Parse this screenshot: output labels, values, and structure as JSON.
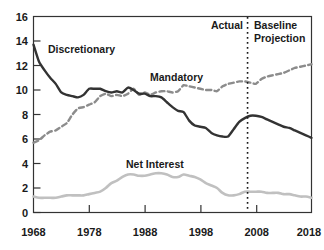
{
  "chart_data": {
    "type": "line",
    "title": "",
    "xlabel": "",
    "ylabel": "",
    "xlim": [
      1968,
      2018
    ],
    "ylim": [
      0,
      16
    ],
    "grid": false,
    "legend_position": "inline-labels",
    "xticks": [
      "1968",
      "1978",
      "1988",
      "1998",
      "2008",
      "2018"
    ],
    "xtick_values": [
      1968,
      1978,
      1988,
      1998,
      2008,
      2018
    ],
    "yticks": [
      "0",
      "2",
      "4",
      "6",
      "8",
      "10",
      "12",
      "14",
      "16"
    ],
    "ytick_values": [
      0,
      2,
      4,
      6,
      8,
      10,
      12,
      14,
      16
    ],
    "x": [
      1968,
      1969,
      1970,
      1971,
      1972,
      1973,
      1974,
      1975,
      1976,
      1977,
      1978,
      1979,
      1980,
      1981,
      1982,
      1983,
      1984,
      1985,
      1986,
      1987,
      1988,
      1989,
      1990,
      1991,
      1992,
      1993,
      1994,
      1995,
      1996,
      1997,
      1998,
      1999,
      2000,
      2001,
      2002,
      2003,
      2004,
      2005,
      2006,
      2007,
      2008,
      2009,
      2010,
      2011,
      2012,
      2013,
      2014,
      2015,
      2016,
      2017,
      2018
    ],
    "series": [
      {
        "name": "Discretionary",
        "style": "solid",
        "color": "#333333",
        "values": [
          13.7,
          12.3,
          11.6,
          11.0,
          10.5,
          9.8,
          9.6,
          9.5,
          9.4,
          9.6,
          10.1,
          10.1,
          10.1,
          9.9,
          9.8,
          9.9,
          9.8,
          10.2,
          10.0,
          9.7,
          9.7,
          9.5,
          9.5,
          9.4,
          9.0,
          8.6,
          8.3,
          8.2,
          7.5,
          7.1,
          7.0,
          6.9,
          6.5,
          6.3,
          6.2,
          6.2,
          6.8,
          7.4,
          7.7,
          7.9,
          7.9,
          7.8,
          7.6,
          7.4,
          7.2,
          7.0,
          6.9,
          6.7,
          6.5,
          6.3,
          6.1
        ]
      },
      {
        "name": "Mandatory",
        "style": "dashed",
        "color": "#8c8c8c",
        "values": [
          5.7,
          5.9,
          6.3,
          6.6,
          6.7,
          7.0,
          7.3,
          8.0,
          8.5,
          8.6,
          8.8,
          9.0,
          9.5,
          9.7,
          9.5,
          9.6,
          9.5,
          9.7,
          10.1,
          9.6,
          9.8,
          9.6,
          9.8,
          9.9,
          9.9,
          9.8,
          9.9,
          10.4,
          10.3,
          10.2,
          10.1,
          10.0,
          10.0,
          9.9,
          10.3,
          10.5,
          10.6,
          10.7,
          10.7,
          10.6,
          10.5,
          10.9,
          11.1,
          11.2,
          11.3,
          11.4,
          11.6,
          11.8,
          11.9,
          12.0,
          12.1
        ]
      },
      {
        "name": "Net Interest",
        "style": "solid",
        "color": "#c0c0c0",
        "values": [
          1.3,
          1.2,
          1.2,
          1.2,
          1.2,
          1.3,
          1.4,
          1.4,
          1.4,
          1.4,
          1.5,
          1.6,
          1.7,
          2.0,
          2.4,
          2.6,
          2.9,
          3.1,
          3.1,
          3.0,
          3.0,
          3.1,
          3.2,
          3.2,
          3.1,
          2.9,
          2.9,
          3.1,
          3.0,
          2.9,
          2.7,
          2.4,
          2.2,
          2.0,
          1.6,
          1.4,
          1.4,
          1.5,
          1.7,
          1.7,
          1.7,
          1.7,
          1.6,
          1.6,
          1.6,
          1.5,
          1.5,
          1.4,
          1.3,
          1.3,
          1.2
        ]
      }
    ],
    "annotations": [
      {
        "id": "divider",
        "type": "vline",
        "style": "dotted",
        "x": 2006.5
      },
      {
        "id": "actual",
        "type": "text",
        "text": "Actual"
      },
      {
        "id": "baseline",
        "type": "text",
        "text": "Baseline"
      },
      {
        "id": "projection",
        "type": "text",
        "text": "Projection"
      }
    ],
    "inline_labels": [
      {
        "id": "discretionary",
        "text": "Discretionary"
      },
      {
        "id": "mandatory",
        "text": "Mandatory"
      },
      {
        "id": "net-interest",
        "text": "Net Interest"
      }
    ]
  },
  "colors": {
    "axis": "#333333",
    "discretionary": "#333333",
    "mandatory": "#8c8c8c",
    "net_interest": "#c0c0c0",
    "text": "#1a1a1a",
    "background": "#ffffff"
  },
  "labels": {
    "discretionary": "Discretionary",
    "mandatory": "Mandatory",
    "net_interest": "Net Interest",
    "actual": "Actual",
    "baseline": "Baseline",
    "projection": "Projection",
    "y0": "0",
    "y2": "2",
    "y4": "4",
    "y6": "6",
    "y8": "8",
    "y10": "10",
    "y12": "12",
    "y14": "14",
    "y16": "16",
    "x1968": "1968",
    "x1978": "1978",
    "x1988": "1988",
    "x1998": "1998",
    "x2008": "2008",
    "x2018": "2018"
  }
}
